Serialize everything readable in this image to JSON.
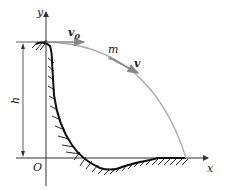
{
  "diagram": {
    "type": "projectile-motion-from-cliff",
    "labels": {
      "y_axis": "y",
      "x_axis": "x",
      "origin": "O",
      "height": "h",
      "mass": "m",
      "initial_velocity": "v",
      "initial_velocity_subscript": "0",
      "velocity": "v"
    },
    "colors": {
      "axes": "#333333",
      "trajectory": "#aaaaaa",
      "terrain": "#111111",
      "vector": "#888888"
    }
  }
}
